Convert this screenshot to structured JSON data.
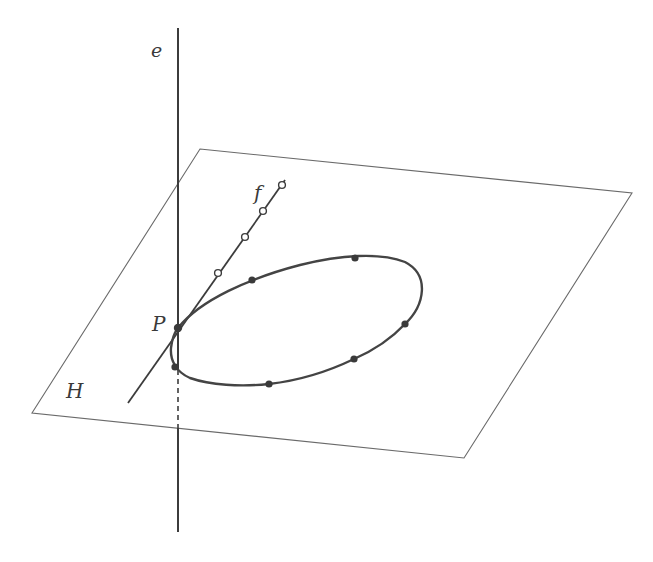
{
  "diagram": {
    "colors": {
      "background": "#ffffff",
      "plane_edge": "#6a6a6a",
      "line": "#3c3c3c",
      "curve": "#444444",
      "point_fill": "#3a3a3a",
      "open_point_fill": "#ffffff"
    },
    "labels": {
      "line_e": "e",
      "line_f": "f",
      "point_P": "P",
      "plane_H": "H"
    },
    "plane_H": {
      "corners": [
        [
          200,
          149
        ],
        [
          632,
          193
        ],
        [
          464,
          458
        ],
        [
          32,
          413
        ]
      ]
    },
    "line_e": {
      "x": 178,
      "top": 28,
      "bottom": 532,
      "dashed_from": 370,
      "dashed_to": 428
    },
    "line_f": {
      "from": [
        128,
        403
      ],
      "to": [
        285,
        180
      ]
    },
    "point_P": [
      178,
      328
    ],
    "curve_points_filled": [
      [
        252,
        280
      ],
      [
        355,
        258
      ],
      [
        405,
        324
      ],
      [
        354,
        359
      ],
      [
        269,
        384
      ],
      [
        175,
        367
      ]
    ],
    "line_f_points_open": [
      [
        218,
        273
      ],
      [
        245,
        237
      ],
      [
        263,
        211
      ],
      [
        282,
        185
      ]
    ]
  }
}
